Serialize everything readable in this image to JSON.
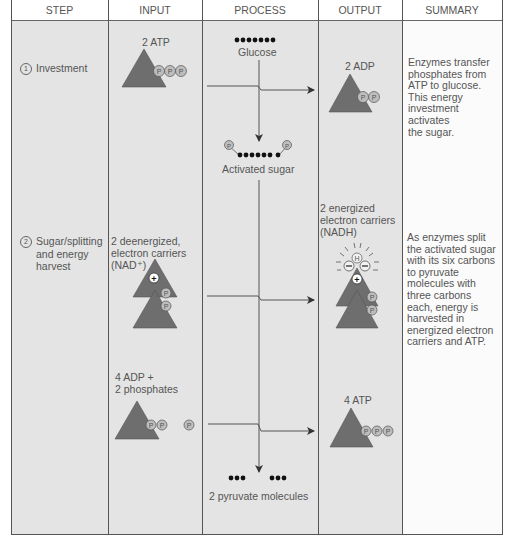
{
  "headers": {
    "step": "STEP",
    "input": "INPUT",
    "process": "PROCESS",
    "output": "OUTPUT",
    "summary": "SUMMARY"
  },
  "rows": [
    {
      "step_number": "1",
      "step_label": "Investment",
      "input_label": "2 ATP",
      "process_top_label": "Glucose",
      "process_bottom_label": "Activated sugar",
      "output_label": "2 ADP",
      "summary_lines": [
        "Enzymes transfer",
        "phosphates from",
        "ATP to glucose.",
        "This energy",
        "investment",
        "activates",
        "the sugar."
      ]
    },
    {
      "step_number": "2",
      "step_label_lines": [
        "Sugar/splitting",
        "and energy",
        "harvest"
      ],
      "input_label_lines": [
        "2 deenergized,",
        "electron carriers",
        "(NAD⁺)"
      ],
      "output_label_lines": [
        "2 energized",
        "electron carriers",
        "(NADH)"
      ],
      "input2_label_lines": [
        "4 ADP +",
        "2 phosphates"
      ],
      "output2_label": "4 ATP",
      "process_bottom_label": "2 pyruvate molecules",
      "summary_lines": [
        "As enzymes split",
        "the activated sugar",
        "with its six carbons",
        "to pyruvate",
        "molecules with",
        "three carbons",
        "each, energy is",
        "harvested in",
        "energized electron",
        "carriers and ATP."
      ]
    }
  ],
  "glyphs": {
    "phosphate": "P",
    "hydrogen": "H",
    "plus": "+",
    "minus": "−"
  },
  "colors": {
    "triangle": "#6e6e6e",
    "phosphate_fill": "#bdbdbd",
    "cell_gray": "#e4e4e4",
    "summary_bg": "#fbfbfb",
    "line": "#555555"
  }
}
